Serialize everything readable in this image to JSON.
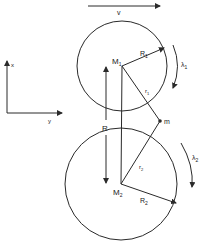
{
  "diagram": {
    "velocity_label": "v",
    "axis_x_label": "x",
    "axis_y_label": "y",
    "upper_body": {
      "center_label": "M",
      "center_sub": "1",
      "radius_label": "R",
      "radius_sub": "1",
      "spin_label": "λ",
      "spin_sub": "1",
      "distance_label": "r",
      "distance_sub": "1"
    },
    "lower_body": {
      "center_label": "M",
      "center_sub": "2",
      "radius_label": "R",
      "radius_sub": "2",
      "spin_label": "λ",
      "spin_sub": "2",
      "distance_label": "r",
      "distance_sub": "2"
    },
    "separation_label": "R",
    "point_label": "m",
    "colors": {
      "ink": "#2a2a2a",
      "background": "#ffffff"
    }
  }
}
